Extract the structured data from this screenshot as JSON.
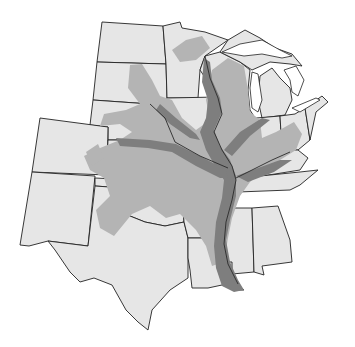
{
  "map": {
    "subject": "Mississippi River basin across central United States",
    "colors": {
      "background": "#ffffff",
      "state_fill": "#e6e6e6",
      "border": "#222222",
      "light_zone": "#b4b4b4",
      "dark_zone": "#7e7e7e"
    },
    "legend": []
  }
}
